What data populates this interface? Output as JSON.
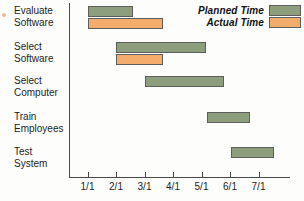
{
  "chart_data": {
    "type": "bar",
    "subtype": "gantt",
    "title": "",
    "xlabel": "",
    "ylabel": "",
    "grid": false,
    "legend_position": "top-right",
    "x_tick_labels": [
      "1/1",
      "2/1",
      "3/1",
      "4/1",
      "5/1",
      "6/1",
      "7/1"
    ],
    "x_tick_values": [
      1,
      2,
      3,
      4,
      5,
      6,
      7
    ],
    "xlim": [
      0.4,
      8.1
    ],
    "categories": [
      "Evaluate Software",
      "Select Software",
      "Select Computer",
      "Train Employees",
      "Test System"
    ],
    "series": [
      {
        "name": "Planned Time",
        "color": "#8d9e7c",
        "bars": [
          {
            "task": "Evaluate Software",
            "start": 1.0,
            "end": 2.6
          },
          {
            "task": "Select Software",
            "start": 2.0,
            "end": 5.15
          },
          {
            "task": "Select Computer",
            "start": 3.0,
            "end": 5.8
          },
          {
            "task": "Train Employees",
            "start": 5.2,
            "end": 6.7
          },
          {
            "task": "Test System",
            "start": 6.05,
            "end": 7.55
          }
        ]
      },
      {
        "name": "Actual Time",
        "color": "#f2ac6c",
        "bars": [
          {
            "task": "Evaluate Software",
            "start": 1.0,
            "end": 3.65
          },
          {
            "task": "Select Software",
            "start": 2.0,
            "end": 3.65
          }
        ]
      }
    ]
  },
  "legend": {
    "items": [
      {
        "label": "Planned Time",
        "swatch": "planned"
      },
      {
        "label": "Actual Time",
        "swatch": "actual"
      }
    ]
  },
  "tasks": [
    {
      "label": "Evaluate\nSoftware"
    },
    {
      "label": "Select\nSoftware"
    },
    {
      "label": "Select\nComputer"
    },
    {
      "label": "Train\nEmployees"
    },
    {
      "label": "Test\nSystem"
    }
  ],
  "colors": {
    "planned": "#8d9e7c",
    "actual": "#f2ac6c",
    "axis": "#4a4a4a",
    "bar_border": "#5e5e5e",
    "text": "#1d1d1d",
    "background": "#fdfdfb"
  }
}
